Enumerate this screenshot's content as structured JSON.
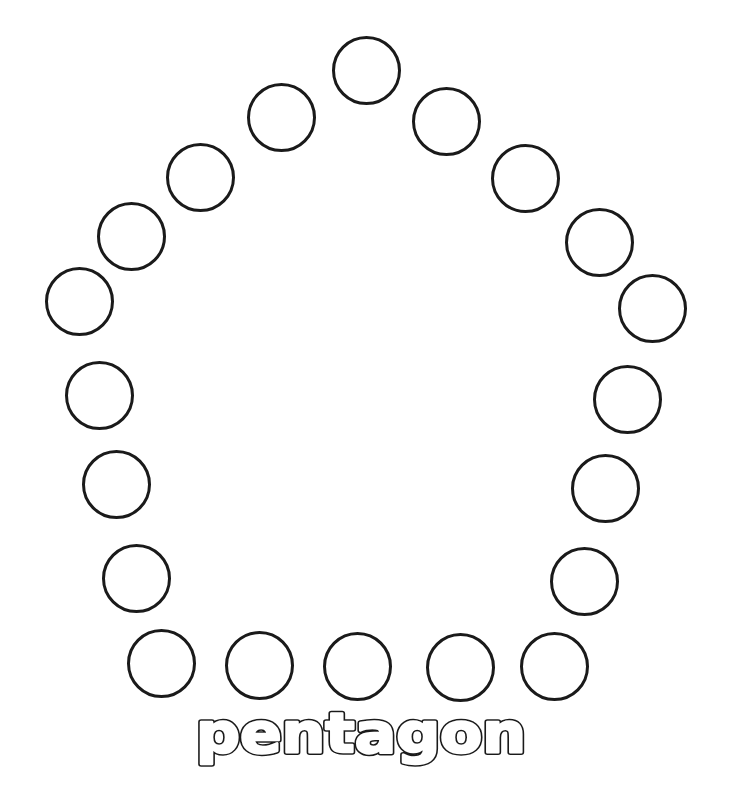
{
  "worksheet": {
    "shape_name": "pentagon",
    "label": {
      "text": "pentagon",
      "x": 361,
      "baseline_y": 752,
      "font_size": 56,
      "text_length": 330,
      "stroke_color": "#1a1a1a",
      "fill_color": "#ffffff",
      "stroke_width": 5.5,
      "inner_stroke_width": 2.5
    },
    "circle_style": {
      "diameter": 69,
      "border_width": 3.5,
      "border_color": "#1a1a1a"
    },
    "circles": [
      {
        "id": "top",
        "cx": 366,
        "cy": 70
      },
      {
        "id": "upper-left-1",
        "cx": 281,
        "cy": 117
      },
      {
        "id": "upper-left-2",
        "cx": 200,
        "cy": 177
      },
      {
        "id": "upper-left-3",
        "cx": 131,
        "cy": 236
      },
      {
        "id": "left-corner",
        "cx": 79,
        "cy": 301
      },
      {
        "id": "left-side-1",
        "cx": 99,
        "cy": 395
      },
      {
        "id": "left-side-2",
        "cx": 116,
        "cy": 484
      },
      {
        "id": "left-side-3",
        "cx": 136,
        "cy": 578
      },
      {
        "id": "bottom-1",
        "cx": 161,
        "cy": 663
      },
      {
        "id": "bottom-2",
        "cx": 259,
        "cy": 665
      },
      {
        "id": "bottom-3",
        "cx": 357,
        "cy": 666
      },
      {
        "id": "bottom-4",
        "cx": 460,
        "cy": 667
      },
      {
        "id": "bottom-5",
        "cx": 554,
        "cy": 666
      },
      {
        "id": "right-side-3",
        "cx": 584,
        "cy": 581
      },
      {
        "id": "right-side-2",
        "cx": 605,
        "cy": 488
      },
      {
        "id": "right-side-1",
        "cx": 627,
        "cy": 399
      },
      {
        "id": "right-corner",
        "cx": 652,
        "cy": 308
      },
      {
        "id": "upper-right-3",
        "cx": 599,
        "cy": 242
      },
      {
        "id": "upper-right-2",
        "cx": 525,
        "cy": 178
      },
      {
        "id": "upper-right-1",
        "cx": 446,
        "cy": 121
      }
    ]
  }
}
